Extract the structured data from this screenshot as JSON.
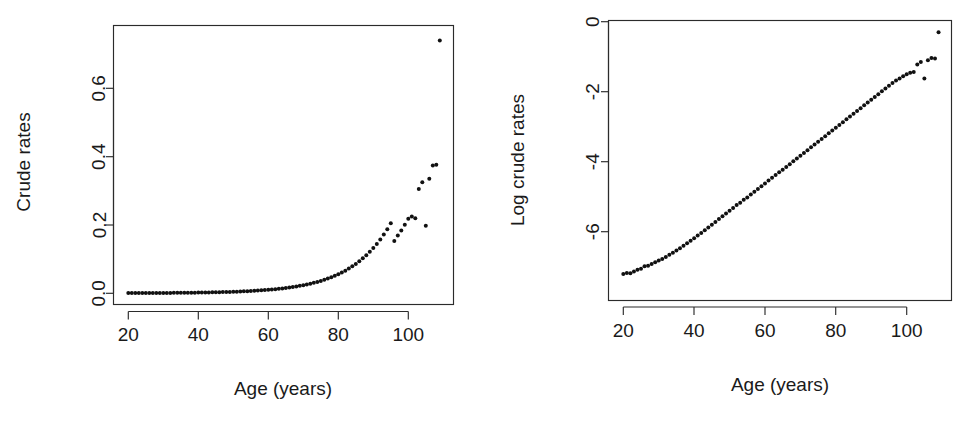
{
  "figure": {
    "background": "#ffffff",
    "point_color": "#111111",
    "axis_color": "#2b2b2b",
    "panels": [
      "crude-rates-panel",
      "log-crude-rates-panel"
    ]
  },
  "chart_data": [
    {
      "type": "scatter",
      "name": "crude-rates-panel",
      "title": "",
      "xlabel": "Age (years)",
      "ylabel": "Crude rates",
      "xlim": [
        18,
        112
      ],
      "ylim": [
        -0.02,
        0.78
      ],
      "xticks": [
        20,
        40,
        60,
        80,
        100
      ],
      "xtick_labels": [
        "20",
        "40",
        "60",
        "80",
        "100"
      ],
      "yticks": [
        0.0,
        0.2,
        0.4,
        0.6
      ],
      "ytick_labels": [
        "0.0",
        "0.2",
        "0.4",
        "0.6"
      ],
      "grid": false,
      "legend": "none",
      "x": [
        20,
        21,
        22,
        23,
        24,
        25,
        26,
        27,
        28,
        29,
        30,
        31,
        32,
        33,
        34,
        35,
        36,
        37,
        38,
        39,
        40,
        41,
        42,
        43,
        44,
        45,
        46,
        47,
        48,
        49,
        50,
        51,
        52,
        53,
        54,
        55,
        56,
        57,
        58,
        59,
        60,
        61,
        62,
        63,
        64,
        65,
        66,
        67,
        68,
        69,
        70,
        71,
        72,
        73,
        74,
        75,
        76,
        77,
        78,
        79,
        80,
        81,
        82,
        83,
        84,
        85,
        86,
        87,
        88,
        89,
        90,
        91,
        92,
        93,
        94,
        95,
        96,
        97,
        98,
        99,
        100,
        101,
        102,
        103,
        104,
        105,
        106,
        107,
        108,
        109
      ],
      "y": [
        0.00074,
        0.00076,
        0.00075,
        0.00079,
        0.00083,
        0.00086,
        0.00092,
        0.00094,
        0.00099,
        0.00104,
        0.00109,
        0.00114,
        0.00121,
        0.00128,
        0.00136,
        0.00145,
        0.00155,
        0.00166,
        0.00178,
        0.00191,
        0.00206,
        0.00222,
        0.00239,
        0.00258,
        0.00279,
        0.00302,
        0.00327,
        0.00354,
        0.00383,
        0.00415,
        0.0045,
        0.00488,
        0.0053,
        0.00575,
        0.00624,
        0.00678,
        0.00736,
        0.008,
        0.00869,
        0.00944,
        0.01026,
        0.01115,
        0.01212,
        0.01318,
        0.01433,
        0.01558,
        0.01694,
        0.01843,
        0.02004,
        0.02181,
        0.02373,
        0.02583,
        0.02812,
        0.03062,
        0.03335,
        0.03633,
        0.03958,
        0.04313,
        0.047,
        0.05122,
        0.05583,
        0.06085,
        0.06634,
        0.07233,
        0.07886,
        0.08599,
        0.09377,
        0.10225,
        0.11151,
        0.1216,
        0.13262,
        0.14464,
        0.15775,
        0.17206,
        0.18767,
        0.2047,
        0.153,
        0.169,
        0.184,
        0.201,
        0.218,
        0.225,
        0.22,
        0.305,
        0.325,
        0.198,
        0.335,
        0.374,
        0.376,
        0.74,
        0.605,
        0.345
      ],
      "outliers": [
        {
          "x": 108,
          "y": 0.74
        },
        {
          "x": 109,
          "y": 0.605
        },
        {
          "x": 104,
          "y": 0.198
        }
      ]
    },
    {
      "type": "scatter",
      "name": "log-crude-rates-panel",
      "title": "",
      "xlabel": "Age (years)",
      "ylabel": "Log crude rates",
      "xlim": [
        18,
        112
      ],
      "ylim": [
        -7.6,
        0.1
      ],
      "xticks": [
        20,
        40,
        60,
        80,
        100
      ],
      "xtick_labels": [
        "20",
        "40",
        "60",
        "80",
        "100"
      ],
      "yticks": [
        0,
        -2,
        -4,
        -6
      ],
      "ytick_labels": [
        "0",
        "-2",
        "-4",
        "-6"
      ],
      "grid": false,
      "legend": "none",
      "x": [
        20,
        21,
        22,
        23,
        24,
        25,
        26,
        27,
        28,
        29,
        30,
        31,
        32,
        33,
        34,
        35,
        36,
        37,
        38,
        39,
        40,
        41,
        42,
        43,
        44,
        45,
        46,
        47,
        48,
        49,
        50,
        51,
        52,
        53,
        54,
        55,
        56,
        57,
        58,
        59,
        60,
        61,
        62,
        63,
        64,
        65,
        66,
        67,
        68,
        69,
        70,
        71,
        72,
        73,
        74,
        75,
        76,
        77,
        78,
        79,
        80,
        81,
        82,
        83,
        84,
        85,
        86,
        87,
        88,
        89,
        90,
        91,
        92,
        93,
        94,
        95,
        96,
        97,
        98,
        99,
        100,
        101,
        102,
        103,
        104,
        105,
        106,
        107,
        108,
        109
      ],
      "y": [
        -7.21,
        -7.18,
        -7.19,
        -7.14,
        -7.09,
        -7.06,
        -6.99,
        -6.97,
        -6.92,
        -6.87,
        -6.82,
        -6.78,
        -6.72,
        -6.66,
        -6.6,
        -6.54,
        -6.47,
        -6.4,
        -6.33,
        -6.26,
        -6.19,
        -6.11,
        -6.04,
        -5.96,
        -5.88,
        -5.8,
        -5.72,
        -5.64,
        -5.56,
        -5.48,
        -5.4,
        -5.32,
        -5.24,
        -5.17,
        -5.09,
        -5.02,
        -4.94,
        -4.86,
        -4.78,
        -4.7,
        -4.62,
        -4.54,
        -4.46,
        -4.38,
        -4.3,
        -4.23,
        -4.15,
        -4.07,
        -3.99,
        -3.91,
        -3.83,
        -3.75,
        -3.67,
        -3.59,
        -3.51,
        -3.43,
        -3.35,
        -3.27,
        -3.19,
        -3.11,
        -3.03,
        -2.95,
        -2.87,
        -2.79,
        -2.71,
        -2.63,
        -2.55,
        -2.47,
        -2.39,
        -2.31,
        -2.23,
        -2.15,
        -2.07,
        -1.99,
        -1.91,
        -1.83,
        -1.75,
        -1.68,
        -1.62,
        -1.56,
        -1.5,
        -1.46,
        -1.44,
        -1.22,
        -1.15,
        -1.62,
        -1.1,
        -1.04,
        -1.05,
        -0.3,
        -0.5,
        -1.08
      ],
      "outliers": [
        {
          "x": 108,
          "y": -0.3
        },
        {
          "x": 109,
          "y": -0.5
        },
        {
          "x": 104,
          "y": -1.62
        }
      ]
    }
  ],
  "panel_left": {
    "axis_x_title": "Age (years)",
    "axis_y_title": "Crude rates",
    "xtick_labels": [
      "20",
      "40",
      "60",
      "80",
      "100"
    ],
    "ytick_labels": [
      "0.0",
      "0.2",
      "0.4",
      "0.6"
    ]
  },
  "panel_right": {
    "axis_x_title": "Age (years)",
    "axis_y_title": "Log crude rates",
    "xtick_labels": [
      "20",
      "40",
      "60",
      "80",
      "100"
    ],
    "ytick_labels": [
      "0",
      "-2",
      "-4",
      "-6"
    ]
  }
}
